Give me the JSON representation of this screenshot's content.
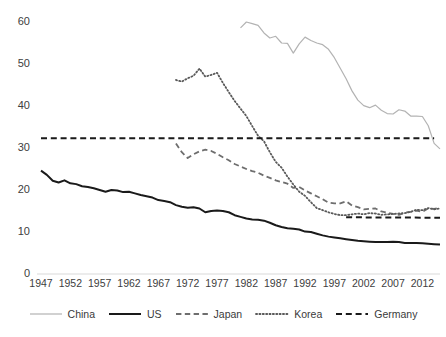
{
  "chart_data": {
    "type": "line",
    "title": "",
    "subtitle": "",
    "xlabel": "",
    "ylabel": "",
    "xlim": [
      1947,
      2015
    ],
    "ylim": [
      0,
      60
    ],
    "grid": false,
    "legend_position": "bottom",
    "y_ticks": [
      0,
      10,
      20,
      30,
      40,
      50,
      60
    ],
    "y_tick_labels": [
      "0",
      "10",
      "20",
      "30",
      "40",
      "50",
      "60"
    ],
    "x_ticks": [
      1947,
      1952,
      1957,
      1962,
      1967,
      1972,
      1977,
      1982,
      1987,
      1992,
      1997,
      2002,
      2007,
      2012
    ],
    "x_tick_labels": [
      "1947",
      "1952",
      "1957",
      "1962",
      "1967",
      "1972",
      "1977",
      "1982",
      "1987",
      "1992",
      "1997",
      "2002",
      "2007",
      "2012"
    ],
    "series": [
      {
        "name": "China",
        "color": "#b3b3b3",
        "style": "solid",
        "width": 1.2,
        "x": [
          1981,
          1982,
          1983,
          1984,
          1985,
          1986,
          1987,
          1988,
          1989,
          1990,
          1991,
          1992,
          1993,
          1994,
          1995,
          1996,
          1997,
          1998,
          1999,
          2000,
          2001,
          2002,
          2003,
          2004,
          2005,
          2006,
          2007,
          2008,
          2009,
          2010,
          2011,
          2012,
          2013,
          2014,
          2015
        ],
        "values": [
          58.6,
          60.0,
          59.6,
          59.2,
          57.4,
          56.2,
          56.6,
          55.0,
          54.9,
          52.6,
          54.8,
          56.4,
          55.6,
          55.0,
          54.6,
          53.5,
          51.5,
          49.0,
          46.5,
          43.6,
          41.4,
          40.1,
          39.6,
          40.2,
          39.0,
          38.2,
          38.1,
          39.1,
          38.8,
          37.6,
          37.6,
          37.5,
          35.3,
          31.1,
          29.8
        ]
      },
      {
        "name": "US",
        "color": "#1a1a1a",
        "style": "solid",
        "width": 2.0,
        "x": [
          1947,
          1948,
          1949,
          1950,
          1951,
          1952,
          1953,
          1954,
          1955,
          1956,
          1957,
          1958,
          1959,
          1960,
          1961,
          1962,
          1963,
          1964,
          1965,
          1966,
          1967,
          1968,
          1969,
          1970,
          1971,
          1972,
          1973,
          1974,
          1975,
          1976,
          1977,
          1978,
          1979,
          1980,
          1981,
          1982,
          1983,
          1984,
          1985,
          1986,
          1987,
          1988,
          1989,
          1990,
          1991,
          1992,
          1993,
          1994,
          1995,
          1996,
          1997,
          1998,
          1999,
          2000,
          2001,
          2002,
          2003,
          2004,
          2005,
          2006,
          2007,
          2008,
          2009,
          2010,
          2011,
          2012,
          2013,
          2014,
          2015
        ],
        "values": [
          24.6,
          23.6,
          22.2,
          21.8,
          22.3,
          21.6,
          21.4,
          20.9,
          20.7,
          20.4,
          20.0,
          19.6,
          20.0,
          19.9,
          19.5,
          19.6,
          19.2,
          18.8,
          18.5,
          18.2,
          17.6,
          17.4,
          17.1,
          16.4,
          16.0,
          15.8,
          15.9,
          15.6,
          14.7,
          15.0,
          15.1,
          15.0,
          14.7,
          14.0,
          13.6,
          13.2,
          13.0,
          12.9,
          12.7,
          12.2,
          11.6,
          11.2,
          10.9,
          10.8,
          10.6,
          10.1,
          10.0,
          9.6,
          9.2,
          8.9,
          8.7,
          8.5,
          8.3,
          8.1,
          7.9,
          7.8,
          7.7,
          7.6,
          7.6,
          7.6,
          7.7,
          7.6,
          7.4,
          7.4,
          7.4,
          7.3,
          7.2,
          7.1,
          7.0
        ]
      },
      {
        "name": "Japan",
        "color": "#6e6e6e",
        "style": "dashed",
        "width": 1.8,
        "x": [
          1970,
          1971,
          1972,
          1973,
          1974,
          1975,
          1976,
          1977,
          1978,
          1979,
          1980,
          1981,
          1982,
          1983,
          1984,
          1985,
          1986,
          1987,
          1988,
          1989,
          1990,
          1991,
          1992,
          1993,
          1994,
          1995,
          1996,
          1997,
          1998,
          1999,
          2000,
          2001,
          2002,
          2003,
          2004,
          2005,
          2006,
          2007,
          2008,
          2009,
          2010,
          2011,
          2012,
          2013,
          2014,
          2015
        ],
        "values": [
          31.1,
          29.0,
          27.6,
          28.5,
          29.2,
          29.6,
          29.3,
          28.6,
          27.8,
          27.1,
          26.2,
          25.6,
          25.0,
          24.5,
          24.1,
          23.4,
          22.9,
          22.3,
          21.9,
          21.5,
          20.5,
          20.7,
          19.9,
          19.2,
          18.5,
          17.8,
          17.0,
          16.8,
          16.8,
          17.3,
          16.3,
          15.9,
          15.4,
          15.5,
          15.6,
          14.9,
          14.6,
          14.3,
          14.1,
          14.6,
          14.8,
          15.1,
          14.8,
          15.6,
          15.5,
          15.8
        ]
      },
      {
        "name": "Korea",
        "color": "#5a5a5a",
        "style": "dotted",
        "width": 1.8,
        "x": [
          1970,
          1971,
          1972,
          1973,
          1974,
          1975,
          1976,
          1977,
          1978,
          1979,
          1980,
          1981,
          1982,
          1983,
          1984,
          1985,
          1986,
          1987,
          1988,
          1989,
          1990,
          1991,
          1992,
          1993,
          1994,
          1995,
          1996,
          1997,
          1998,
          1999,
          2000,
          2001,
          2002,
          2003,
          2004,
          2005,
          2006,
          2007,
          2008,
          2009,
          2010,
          2011,
          2012,
          2013,
          2014,
          2015
        ],
        "values": [
          46.2,
          45.8,
          46.6,
          47.2,
          48.9,
          47.0,
          47.4,
          47.9,
          45.5,
          43.3,
          41.2,
          39.4,
          37.6,
          35.2,
          32.9,
          31.6,
          29.0,
          26.7,
          25.3,
          23.2,
          21.3,
          19.6,
          18.6,
          17.1,
          15.7,
          15.2,
          14.7,
          14.3,
          14.0,
          14.0,
          14.2,
          14.4,
          14.2,
          14.5,
          14.4,
          14.1,
          14.2,
          14.3,
          14.4,
          14.5,
          14.8,
          15.3,
          15.2,
          15.7,
          15.4,
          15.6
        ]
      },
      {
        "name": "Germany",
        "color": "#1a1a1a",
        "style": "dashed",
        "width": 2.0,
        "segments": [
          {
            "x": [
              1947,
              2014
            ],
            "values": [
              32.3,
              32.3
            ]
          },
          {
            "x": [
              1999,
              2015
            ],
            "values": [
              13.5,
              13.4
            ]
          }
        ]
      }
    ]
  },
  "legend": {
    "items": [
      {
        "label": "China"
      },
      {
        "label": "US"
      },
      {
        "label": "Japan"
      },
      {
        "label": "Korea"
      },
      {
        "label": "Germany"
      }
    ]
  },
  "axis": {
    "axis_line_color": "#d9d9d9"
  }
}
